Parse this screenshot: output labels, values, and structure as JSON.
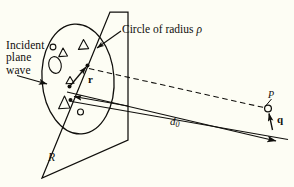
{
  "figure": {
    "domain": "diagram",
    "background_color": "#fdfdf4",
    "ink_color": "#100f0c",
    "width": 294,
    "height": 187
  },
  "labels": {
    "incident_wave": "Incident\nplane\nwave",
    "circle_of_radius": "Circle of radius ",
    "circle_radius_symbol": "ρ",
    "plane_region": "R",
    "distance": "d",
    "distance_subscript": "0",
    "point": "P",
    "scattering_vector": "q",
    "position_vector": "r"
  },
  "geometry": {
    "plane_quad": "128,12 110,12 42,178 128,140",
    "aperture_circle": {
      "cx": 78,
      "cy": 79,
      "rx": 36,
      "ry": 55,
      "rotation": -4
    },
    "scatterers": [
      {
        "type": "triangle",
        "cx": 63,
        "cy": 53,
        "size": 5
      },
      {
        "type": "triangle",
        "cx": 83,
        "cy": 45,
        "size": 6
      },
      {
        "type": "triangle",
        "cx": 64,
        "cy": 103,
        "size": 7
      },
      {
        "type": "triangle",
        "cx": 70,
        "cy": 81,
        "size": 5
      },
      {
        "type": "ellipse",
        "cx": 55,
        "cy": 65,
        "rx": 6,
        "ry": 8
      },
      {
        "type": "circle",
        "cx": 53,
        "cy": 47,
        "r": 3
      },
      {
        "type": "circle",
        "cx": 80,
        "cy": 112,
        "r": 3
      }
    ],
    "r_vector": {
      "x1": 70,
      "y1": 86,
      "x2": 87,
      "y2": 66
    },
    "dashed_ray": {
      "x1": 88,
      "y1": 69,
      "x2": 268,
      "y2": 109
    },
    "d0_line_upper": {
      "x1": 68,
      "y1": 92,
      "x2": 274,
      "y2": 140
    },
    "d0_line_lower": {
      "x1": 72,
      "y1": 101,
      "x2": 283,
      "y2": 140
    },
    "incident_arrow": {
      "x1": 18,
      "y1": 76,
      "x2": 48,
      "y2": 84
    },
    "inward_arrow": {
      "x1": 126,
      "y1": 105,
      "x2": 73,
      "y2": 96
    },
    "circle_leader": {
      "x1": 120,
      "y1": 32,
      "x2": 96,
      "y2": 49
    },
    "point_P_marker": {
      "cx": 268,
      "cy": 108,
      "r": 3.4
    },
    "q_vector": {
      "x1": 272,
      "y1": 129,
      "x2": 269,
      "y2": 113
    }
  }
}
